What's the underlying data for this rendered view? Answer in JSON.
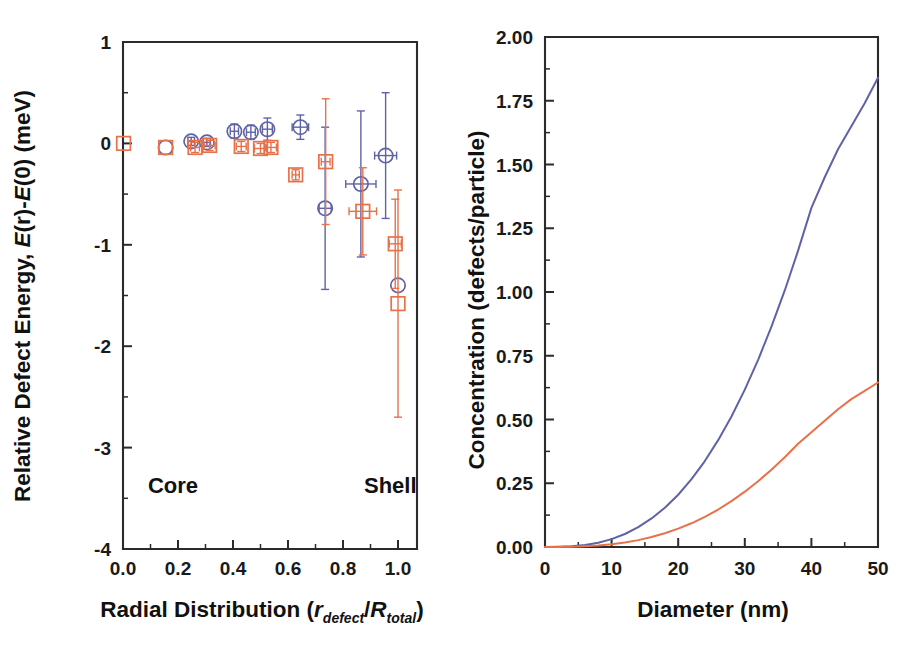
{
  "figure": {
    "background": "#ffffff",
    "colors": {
      "blue": "#5f63a6",
      "orange": "#e8714a",
      "axis": "#2b2b2b",
      "text": "#111111"
    }
  },
  "chart_data": [
    {
      "panel": "left",
      "type": "scatter",
      "title": "",
      "xlabel": "Radial Distribution (r_defect/R_total)",
      "xlabel_parts": {
        "lead": "Radial Distribution (",
        "r_italic": "r",
        "r_sub": "defect",
        "slash": "/",
        "R_italic": "R",
        "R_sub": "total",
        "tail": ")"
      },
      "ylabel": "Relative Defect Energy, E(r)-E(0) (meV)",
      "ylabel_parts": {
        "lead": "Relative Defect Energy, ",
        "e_italic": "E",
        "mid": "(r)-",
        "e2_italic": "E",
        "tail": "(0) (meV)"
      },
      "xlim": [
        -0.05,
        1.1
      ],
      "ylim": [
        -4,
        1
      ],
      "xticks": [
        "0.0",
        "0.2",
        "0.4",
        "0.6",
        "0.8",
        "1.0"
      ],
      "xtick_values": [
        0.0,
        0.2,
        0.4,
        0.6,
        0.8,
        1.0
      ],
      "yticks": [
        "1",
        "0",
        "-1",
        "-2",
        "-3",
        "-4"
      ],
      "ytick_values": [
        1,
        0,
        -1,
        -2,
        -3,
        -4
      ],
      "minor_ticks": true,
      "grid": false,
      "legend": "none",
      "annotations": [
        {
          "text": "Core",
          "x": 0.08,
          "y": -3.45
        },
        {
          "text": "Shell",
          "x": 0.87,
          "y": -3.45
        }
      ],
      "series": [
        {
          "name": "blue-circles",
          "marker": "circle",
          "color": "#5f63a6",
          "points": [
            {
              "x": 0.155,
              "y": -0.04,
              "xerr": 0.0,
              "yerr": 0.0
            },
            {
              "x": 0.248,
              "y": 0.02,
              "xerr": 0.012,
              "yerr": 0.04
            },
            {
              "x": 0.305,
              "y": 0.01,
              "xerr": 0.013,
              "yerr": 0.04
            },
            {
              "x": 0.405,
              "y": 0.12,
              "xerr": 0.015,
              "yerr": 0.07
            },
            {
              "x": 0.465,
              "y": 0.11,
              "xerr": 0.016,
              "yerr": 0.07
            },
            {
              "x": 0.525,
              "y": 0.14,
              "xerr": 0.018,
              "yerr": 0.11
            },
            {
              "x": 0.645,
              "y": 0.16,
              "xerr": 0.03,
              "yerr": 0.12
            },
            {
              "x": 0.735,
              "y": -0.64,
              "xerr": 0.022,
              "yerr": 0.8
            },
            {
              "x": 0.865,
              "y": -0.4,
              "xerr": 0.055,
              "yerr": 0.72
            },
            {
              "x": 0.955,
              "y": -0.12,
              "xerr": 0.04,
              "yerr": 0.62
            },
            {
              "x": 1.0,
              "y": -1.4,
              "xerr": 0.0,
              "yerr": 0.0
            }
          ]
        },
        {
          "name": "orange-squares",
          "marker": "square",
          "color": "#e8714a",
          "points": [
            {
              "x": 0.002,
              "y": 0.0,
              "xerr": 0.0,
              "yerr": 0.0
            },
            {
              "x": 0.155,
              "y": -0.04,
              "xerr": 0.0,
              "yerr": 0.0
            },
            {
              "x": 0.262,
              "y": -0.04,
              "xerr": 0.016,
              "yerr": 0.05
            },
            {
              "x": 0.315,
              "y": -0.02,
              "xerr": 0.02,
              "yerr": 0.05
            },
            {
              "x": 0.43,
              "y": -0.03,
              "xerr": 0.018,
              "yerr": 0.05
            },
            {
              "x": 0.5,
              "y": -0.05,
              "xerr": 0.022,
              "yerr": 0.05
            },
            {
              "x": 0.538,
              "y": -0.04,
              "xerr": 0.02,
              "yerr": 0.05
            },
            {
              "x": 0.628,
              "y": -0.31,
              "xerr": 0.013,
              "yerr": 0.05
            },
            {
              "x": 0.737,
              "y": -0.18,
              "xerr": 0.016,
              "yerr": 0.62
            },
            {
              "x": 0.872,
              "y": -0.67,
              "xerr": 0.05,
              "yerr": 0.43
            },
            {
              "x": 0.99,
              "y": -0.99,
              "xerr": 0.022,
              "yerr": 0.44
            },
            {
              "x": 1.0,
              "y": -1.58,
              "xerr": 0.0,
              "yerr": 1.12
            }
          ]
        }
      ]
    },
    {
      "panel": "right",
      "type": "line",
      "title": "",
      "xlabel": "Diameter (nm)",
      "ylabel": "Concentration (defects/particle)",
      "xlim": [
        0,
        50
      ],
      "ylim": [
        0,
        2.0
      ],
      "xticks": [
        "0",
        "10",
        "20",
        "30",
        "40",
        "50"
      ],
      "xtick_values": [
        0,
        10,
        20,
        30,
        40,
        50
      ],
      "yticks": [
        "0.00",
        "0.25",
        "0.50",
        "0.75",
        "1.00",
        "1.25",
        "1.50",
        "1.75",
        "2.00"
      ],
      "ytick_values": [
        0.0,
        0.25,
        0.5,
        0.75,
        1.0,
        1.25,
        1.5,
        1.75,
        2.0
      ],
      "minor_ticks": true,
      "grid": false,
      "legend": "none",
      "series": [
        {
          "name": "blue-curve",
          "color": "#5f63a6",
          "x": [
            0,
            2,
            4,
            6,
            8,
            10,
            12,
            14,
            16,
            18,
            20,
            22,
            24,
            26,
            28,
            30,
            32,
            34,
            36,
            38,
            40,
            42,
            44,
            46,
            48,
            50
          ],
          "y": [
            0.0,
            0.001,
            0.003,
            0.008,
            0.017,
            0.031,
            0.051,
            0.078,
            0.112,
            0.154,
            0.205,
            0.266,
            0.337,
            0.419,
            0.512,
            0.617,
            0.734,
            0.864,
            1.006,
            1.162,
            1.33,
            1.45,
            1.56,
            1.65,
            1.74,
            1.84
          ]
        },
        {
          "name": "orange-curve",
          "color": "#e8714a",
          "x": [
            0,
            2,
            4,
            6,
            8,
            10,
            12,
            14,
            16,
            18,
            20,
            22,
            24,
            26,
            28,
            30,
            32,
            34,
            36,
            38,
            40,
            42,
            44,
            46,
            48,
            50
          ],
          "y": [
            0.0,
            0.0,
            0.001,
            0.003,
            0.006,
            0.011,
            0.018,
            0.027,
            0.039,
            0.054,
            0.072,
            0.093,
            0.118,
            0.147,
            0.18,
            0.217,
            0.258,
            0.303,
            0.352,
            0.405,
            0.45,
            0.495,
            0.54,
            0.58,
            0.612,
            0.645
          ]
        }
      ]
    }
  ]
}
